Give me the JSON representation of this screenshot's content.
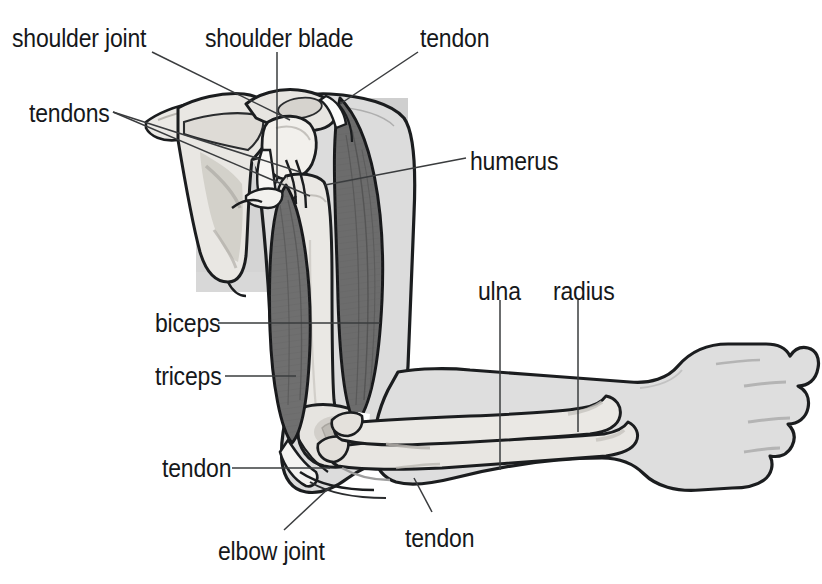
{
  "figure": {
    "type": "anatomical-diagram",
    "background_color": "#ffffff",
    "ink_color": "#16181a",
    "palette": {
      "outline": "#1b1d1f",
      "skin_fill": "#dcdcdc",
      "skin_fill_light": "#e4e4e4",
      "bone_fill": "#eceae6",
      "bone_shadow": "#c9c7c2",
      "muscle_fill": "#6f6f6f",
      "muscle_dark": "#5d5d5d",
      "muscle_fiber": "#4c4c4c",
      "tendon_fill": "#fbfbfa",
      "backdrop_gray": "#d2d2d2",
      "leader_line": "#3a3c3e"
    }
  },
  "labels": [
    {
      "id": "shoulder-joint",
      "text": "shoulder joint",
      "x": 12,
      "y": 25,
      "align": "left"
    },
    {
      "id": "shoulder-blade",
      "text": "shoulder blade",
      "x": 205,
      "y": 25,
      "align": "left"
    },
    {
      "id": "tendon-top",
      "text": "tendon",
      "x": 420,
      "y": 25,
      "align": "left"
    },
    {
      "id": "tendons",
      "text": "tendons",
      "x": 29,
      "y": 100,
      "align": "left"
    },
    {
      "id": "humerus",
      "text": "humerus",
      "x": 470,
      "y": 148,
      "align": "left"
    },
    {
      "id": "ulna",
      "text": "ulna",
      "x": 478,
      "y": 278,
      "align": "left"
    },
    {
      "id": "radius",
      "text": "radius",
      "x": 553,
      "y": 278,
      "align": "left"
    },
    {
      "id": "biceps",
      "text": "biceps",
      "x": 155,
      "y": 310,
      "align": "left"
    },
    {
      "id": "triceps",
      "text": "triceps",
      "x": 155,
      "y": 363,
      "align": "left"
    },
    {
      "id": "tendon-left",
      "text": "tendon",
      "x": 162,
      "y": 455,
      "align": "left"
    },
    {
      "id": "elbow-joint",
      "text": "elbow joint",
      "x": 218,
      "y": 538,
      "align": "left"
    },
    {
      "id": "tendon-bottom",
      "text": "tendon",
      "x": 405,
      "y": 525,
      "align": "left"
    }
  ],
  "leader_lines": [
    {
      "id": "leader-shoulder-joint",
      "from": [
        152,
        52
      ],
      "to": [
        290,
        120
      ]
    },
    {
      "id": "leader-shoulder-blade",
      "from": [
        277,
        52
      ],
      "to": [
        277,
        178
      ]
    },
    {
      "id": "leader-tendon-top",
      "from": [
        418,
        52
      ],
      "to": [
        340,
        104
      ]
    },
    {
      "id": "leader-tendons-a",
      "from": [
        113,
        112
      ],
      "to": [
        300,
        172
      ]
    },
    {
      "id": "leader-tendons-b",
      "from": [
        113,
        112
      ],
      "to": [
        310,
        196
      ]
    },
    {
      "id": "leader-humerus",
      "from": [
        466,
        158
      ],
      "to": [
        325,
        185
      ]
    },
    {
      "id": "leader-ulna",
      "from": [
        500,
        300
      ],
      "to": [
        500,
        470
      ]
    },
    {
      "id": "leader-radius",
      "from": [
        578,
        300
      ],
      "to": [
        578,
        432
      ]
    },
    {
      "id": "leader-biceps",
      "from": [
        218,
        323
      ],
      "to": [
        380,
        323
      ]
    },
    {
      "id": "leader-triceps",
      "from": [
        225,
        376
      ],
      "to": [
        296,
        376
      ]
    },
    {
      "id": "leader-tendon-left",
      "from": [
        232,
        468
      ],
      "to": [
        330,
        468
      ]
    },
    {
      "id": "leader-elbow-joint",
      "from": [
        284,
        530
      ],
      "to": [
        330,
        487
      ]
    },
    {
      "id": "leader-tendon-bottom",
      "from": [
        432,
        512
      ],
      "to": [
        414,
        478
      ]
    }
  ]
}
